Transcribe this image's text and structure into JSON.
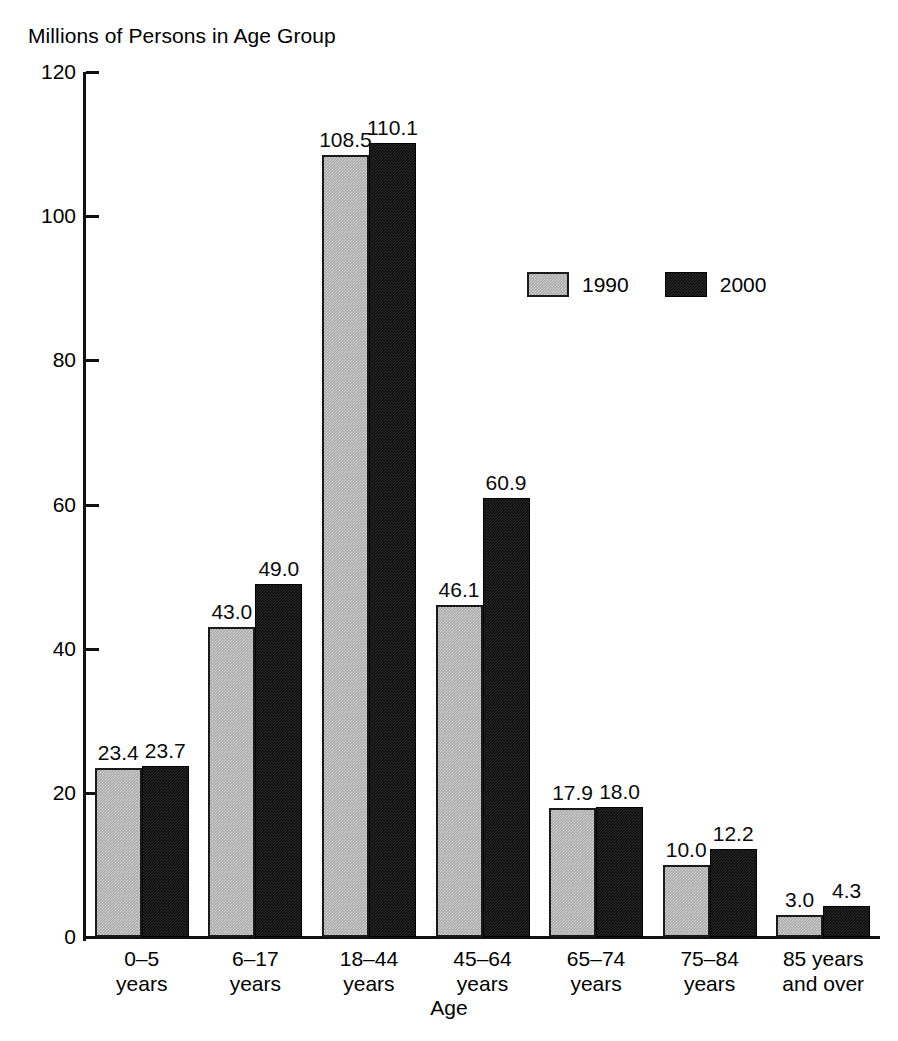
{
  "chart_data": {
    "type": "bar",
    "title": "Millions of Persons in Age Group",
    "xlabel": "Age",
    "ylabel": "Millions of Persons in Age Group",
    "ylim": [
      0,
      120
    ],
    "yticks": [
      0,
      20,
      40,
      60,
      80,
      100,
      120
    ],
    "ytick_labels": [
      "0",
      "20",
      "40",
      "60",
      "80",
      "100",
      "120"
    ],
    "grid": false,
    "legend_position": "upper-center-right",
    "categories": [
      "0–5\nyears",
      "6–17\nyears",
      "18–44\nyears",
      "45–64\nyears",
      "65–74\nyears",
      "75–84\nyears",
      "85 years\nand over"
    ],
    "category_lines": [
      [
        "0–5",
        "years"
      ],
      [
        "6–17",
        "years"
      ],
      [
        "18–44",
        "years"
      ],
      [
        "45–64",
        "years"
      ],
      [
        "65–74",
        "years"
      ],
      [
        "75–84",
        "years"
      ],
      [
        "85 years",
        "and over"
      ]
    ],
    "series": [
      {
        "name": "1990",
        "color": "#a9a9a9",
        "values": [
          23.4,
          43.0,
          108.5,
          46.1,
          17.9,
          10.0,
          3.0
        ],
        "labels": [
          "23.4",
          "43.0",
          "108.5",
          "46.1",
          "17.9",
          "10.0",
          "3.0"
        ]
      },
      {
        "name": "2000",
        "color": "#100f10",
        "values": [
          23.7,
          49.0,
          110.1,
          60.9,
          18.0,
          12.2,
          4.3
        ],
        "labels": [
          "23.7",
          "49.0",
          "110.1",
          "60.9",
          "18.0",
          "12.2",
          "4.3"
        ]
      }
    ]
  },
  "legend": {
    "items": [
      {
        "label": "1990",
        "swatch": "gray-swatch"
      },
      {
        "label": "2000",
        "swatch": "black-swatch"
      }
    ]
  }
}
